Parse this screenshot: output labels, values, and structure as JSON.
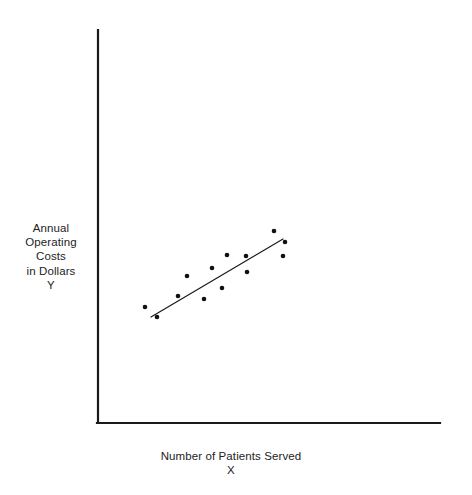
{
  "figure": {
    "background_color": "#ffffff",
    "axis_color": "#1a1a1a",
    "marker_color": "#111111",
    "line_color": "#1a1a1a",
    "text_color": "#232323"
  },
  "ylabel_text": "Annual\nOperating\nCosts\nin Dollars\nY",
  "xlabel_text": "Number of Patients Served\nX",
  "chart_data": {
    "type": "scatter",
    "title": "",
    "xlabel": "Number of Patients Served X",
    "ylabel": "Annual Operating Costs in Dollars Y",
    "grid": false,
    "legend": false,
    "axis_ticks": false,
    "xlim": [
      0,
      100
    ],
    "ylim": [
      0,
      100
    ],
    "axes": {
      "y_axis": {
        "x": 98,
        "y_top": 30,
        "y_bottom": 423
      },
      "x_axis": {
        "y": 423,
        "x_left": 98,
        "x_right": 440
      }
    },
    "points_px": [
      [
        145,
        307
      ],
      [
        157,
        317
      ],
      [
        178,
        296
      ],
      [
        187,
        276
      ],
      [
        204,
        299
      ],
      [
        212,
        268
      ],
      [
        222,
        288
      ],
      [
        227,
        255
      ],
      [
        246,
        256
      ],
      [
        247,
        272
      ],
      [
        274,
        231
      ],
      [
        285,
        242
      ],
      [
        283,
        256
      ]
    ],
    "points": [
      {
        "x": 13.7,
        "y": 29.5
      },
      {
        "x": 17.3,
        "y": 27.0
      },
      {
        "x": 23.4,
        "y": 32.3
      },
      {
        "x": 26.0,
        "y": 37.4
      },
      {
        "x": 31.0,
        "y": 31.6
      },
      {
        "x": 33.3,
        "y": 39.4
      },
      {
        "x": 36.3,
        "y": 34.4
      },
      {
        "x": 37.7,
        "y": 42.8
      },
      {
        "x": 43.3,
        "y": 42.5
      },
      {
        "x": 43.6,
        "y": 38.4
      },
      {
        "x": 51.5,
        "y": 48.9
      },
      {
        "x": 54.7,
        "y": 46.1
      },
      {
        "x": 54.1,
        "y": 42.5
      }
    ],
    "marker": {
      "shape": "circle",
      "size_px": 4.6,
      "color": "#111111"
    },
    "trendline": {
      "type": "linear-fit",
      "start_px": [
        151,
        317
      ],
      "end_px": [
        283,
        239
      ],
      "color": "#1a1a1a",
      "width_px": 1.2
    }
  }
}
